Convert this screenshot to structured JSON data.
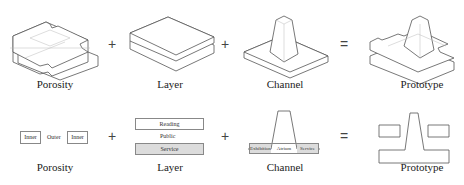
{
  "top_row": {
    "items": [
      {
        "caption": "Porosity",
        "icon": "porosity-block-3d"
      },
      {
        "caption": "Layer",
        "icon": "stacked-layers-3d"
      },
      {
        "caption": "Channel",
        "icon": "tapered-channel-3d"
      },
      {
        "caption": "Prototype",
        "icon": "combined-prototype-3d"
      }
    ],
    "operators": [
      "+",
      "+",
      "="
    ]
  },
  "bottom_row": {
    "porosity": {
      "caption": "Porosity",
      "left_box": "Inner",
      "middle": "Outer",
      "right_box": "Inner"
    },
    "layer": {
      "caption": "Layer",
      "top_box": "Reading",
      "middle": "Public",
      "bottom_box": "Service"
    },
    "channel": {
      "caption": "Channel",
      "left_zone": "Exhibition",
      "middle_zone": "Atrium",
      "right_zone": "Service"
    },
    "prototype": {
      "caption": "Prototype"
    },
    "operators": [
      "+",
      "+",
      "="
    ]
  },
  "colors": {
    "line": "#555555",
    "fill_gray": "#dcdcdc",
    "background": "#ffffff"
  }
}
